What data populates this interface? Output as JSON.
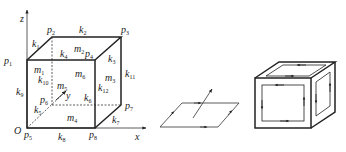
{
  "figure1": {
    "axes": {
      "z": "z",
      "x": "x",
      "y": "y",
      "origin": "O"
    },
    "points": [
      {
        "name": "p",
        "sub": "1",
        "x": 10,
        "y": 64
      },
      {
        "name": "p",
        "sub": "2",
        "x": 47,
        "y": 33
      },
      {
        "name": "p",
        "sub": "3",
        "x": 121,
        "y": 33
      },
      {
        "name": "p",
        "sub": "4",
        "x": 88,
        "y": 57
      },
      {
        "name": "p",
        "sub": "5",
        "x": 24,
        "y": 138
      },
      {
        "name": "p",
        "sub": "6",
        "x": 42,
        "y": 101
      },
      {
        "name": "p",
        "sub": "7",
        "x": 127,
        "y": 109
      },
      {
        "name": "p",
        "sub": "8",
        "x": 90,
        "y": 138
      }
    ],
    "edges": [
      {
        "name": "k",
        "sub": "1",
        "x": 32,
        "y": 45
      },
      {
        "name": "k",
        "sub": "2",
        "x": 79,
        "y": 33
      },
      {
        "name": "k",
        "sub": "3",
        "x": 107,
        "y": 61
      },
      {
        "name": "k",
        "sub": "4",
        "x": 60,
        "y": 55
      },
      {
        "name": "k",
        "sub": "5",
        "x": 33,
        "y": 112
      },
      {
        "name": "k",
        "sub": "6",
        "x": 83,
        "y": 101
      },
      {
        "name": "k",
        "sub": "7",
        "x": 112,
        "y": 122
      },
      {
        "name": "k",
        "sub": "8",
        "x": 58,
        "y": 139
      },
      {
        "name": "k",
        "sub": "9",
        "x": 16,
        "y": 93
      },
      {
        "name": "k",
        "sub": "10",
        "x": 38,
        "y": 81
      },
      {
        "name": "k",
        "sub": "11",
        "x": 125,
        "y": 77
      },
      {
        "name": "k",
        "sub": "12",
        "x": 97,
        "y": 89
      }
    ],
    "faces": [
      {
        "name": "m",
        "sub": "1",
        "x": 34,
        "y": 72
      },
      {
        "name": "m",
        "sub": "2",
        "x": 75,
        "y": 51
      },
      {
        "name": "m",
        "sub": "3",
        "x": 105,
        "y": 80
      },
      {
        "name": "m",
        "sub": "4",
        "x": 67,
        "y": 120
      },
      {
        "name": "m",
        "sub": "5",
        "x": 57,
        "y": 88
      },
      {
        "name": "m",
        "sub": "6",
        "x": 75,
        "y": 76
      }
    ]
  },
  "figure2": {
    "description": "oriented parallelogram with normal arrow"
  },
  "figure3": {
    "description": "cube with oriented face circulations"
  }
}
